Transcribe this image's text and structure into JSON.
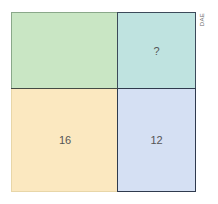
{
  "diagram": {
    "type": "area-model",
    "cells": {
      "top_left": {
        "label": "",
        "color": "#c9e6c4"
      },
      "top_right": {
        "label": "?",
        "color": "#bfe3e0"
      },
      "bottom_left": {
        "label": "16",
        "color": "#fbe8c0"
      },
      "bottom_right": {
        "label": "12",
        "color": "#d5e0f3"
      }
    },
    "credit": "DAE"
  }
}
